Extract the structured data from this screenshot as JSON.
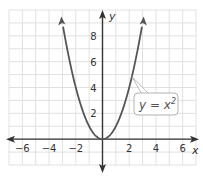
{
  "chart_data": {
    "type": "line",
    "title": "",
    "xlabel": "x",
    "ylabel": "y",
    "xlim": [
      -7,
      7
    ],
    "ylim": [
      -2,
      10
    ],
    "grid": true,
    "x_ticks": [
      -6,
      -4,
      -2,
      2,
      4,
      6
    ],
    "y_ticks": [
      2,
      4,
      6,
      8
    ],
    "x_tick_labels": [
      "−6",
      "−4",
      "−2",
      "2",
      "4",
      "6"
    ],
    "y_tick_labels": [
      "2",
      "4",
      "6",
      "8"
    ],
    "series": [
      {
        "name": "y = x^2",
        "equation": "y = x^2",
        "x": [
          -3,
          -2.5,
          -2,
          -1.5,
          -1,
          -0.5,
          0,
          0.5,
          1,
          1.5,
          2,
          2.5,
          3
        ],
        "values": [
          9,
          6.25,
          4,
          2.25,
          1,
          0.25,
          0,
          0.25,
          1,
          2.25,
          4,
          6.25,
          9
        ]
      }
    ],
    "annotations": [
      {
        "text": "y = x",
        "superscript": "2",
        "points_to": [
          2.2,
          4.84
        ]
      }
    ],
    "colors": {
      "curve": "#555555",
      "axis": "#333333",
      "grid": "#d9d9d9"
    }
  },
  "labels": {
    "x_axis": "x",
    "y_axis": "y",
    "callout_base": "y = x",
    "callout_sup": "2"
  }
}
